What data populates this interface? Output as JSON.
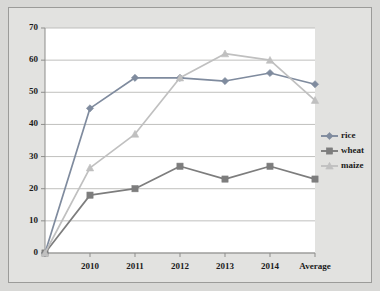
{
  "chart_data": {
    "type": "line",
    "title": "",
    "subtitle": "",
    "xlabel": "",
    "ylabel": "",
    "categories": [
      "",
      "2010",
      "2011",
      "2012",
      "2013",
      "2014",
      "Average"
    ],
    "series": [
      {
        "name": "rice",
        "color": "#7f8b9e",
        "marker": "diamond",
        "values": [
          0,
          45,
          54.5,
          54.5,
          53.5,
          56,
          52.5
        ]
      },
      {
        "name": "wheat",
        "color": "#7d7d7d",
        "marker": "square",
        "values": [
          0,
          18,
          20,
          27,
          23,
          27,
          23
        ]
      },
      {
        "name": "maize",
        "color": "#c0c0c0",
        "marker": "triangle",
        "values": [
          0,
          26.5,
          37,
          54.5,
          62,
          60,
          47.5
        ]
      }
    ],
    "ylim": [
      0,
      70
    ],
    "ytick_values": [
      0,
      10,
      20,
      30,
      40,
      50,
      60,
      70
    ],
    "ytick_labels": [
      "0",
      "10",
      "20",
      "30",
      "40",
      "50",
      "60",
      "70"
    ],
    "grid": true,
    "legend_position": "right",
    "legend_entries": [
      "rice",
      "wheat",
      "maize"
    ]
  },
  "style": {
    "plot_background": "#ffffff",
    "canvas_background": "#e2e2e0",
    "frame_background": "#d8d8d6",
    "gridline_color": "#b9b9b7",
    "axis_color": "#8d8d8b",
    "text_color": "#1b1b1b"
  }
}
